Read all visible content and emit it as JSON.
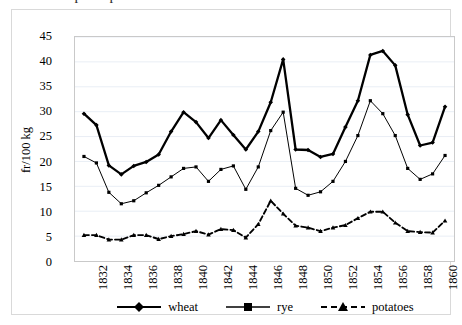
{
  "title_cropped": "Graph of prices",
  "axes": {
    "y_title": "fr/100 kg",
    "y_ticks": [
      0,
      5,
      10,
      15,
      20,
      25,
      30,
      35,
      40,
      45
    ],
    "x_ticks": [
      1832,
      1834,
      1836,
      1838,
      1840,
      1842,
      1844,
      1846,
      1848,
      1850,
      1852,
      1854,
      1856,
      1858,
      1860
    ]
  },
  "legend": {
    "position": "bottom",
    "items": [
      {
        "label": "wheat",
        "marker": "diamond-marker",
        "line": "solid",
        "color": "#000000"
      },
      {
        "label": "rye",
        "marker": "square-marker",
        "line": "solid",
        "color": "#000000"
      },
      {
        "label": "potatoes",
        "marker": "triangle-marker",
        "line": "dashed",
        "color": "#000000"
      }
    ]
  },
  "chart_data": {
    "type": "line",
    "title": "Graph of prices",
    "xlabel": "",
    "ylabel": "fr/100 kg",
    "ylim": [
      0,
      45
    ],
    "xlim": [
      1831,
      1860
    ],
    "grid": "horizontal",
    "x": [
      1831,
      1832,
      1833,
      1834,
      1835,
      1836,
      1837,
      1838,
      1839,
      1840,
      1841,
      1842,
      1843,
      1844,
      1845,
      1846,
      1847,
      1848,
      1849,
      1850,
      1851,
      1852,
      1853,
      1854,
      1855,
      1856,
      1857,
      1858,
      1859,
      1860
    ],
    "categories": [
      "1831",
      "1832",
      "1833",
      "1834",
      "1835",
      "1836",
      "1837",
      "1838",
      "1839",
      "1840",
      "1841",
      "1842",
      "1843",
      "1844",
      "1845",
      "1846",
      "1847",
      "1848",
      "1849",
      "1850",
      "1851",
      "1852",
      "1853",
      "1854",
      "1855",
      "1856",
      "1857",
      "1858",
      "1859",
      "1860"
    ],
    "series": [
      {
        "name": "wheat",
        "marker": "diamond",
        "linestyle": "solid",
        "color": "#000000",
        "values": [
          29.6,
          27.3,
          19.2,
          17.4,
          19.1,
          19.9,
          21.4,
          26.0,
          29.9,
          27.9,
          24.7,
          28.3,
          25.3,
          22.4,
          26.0,
          31.9,
          40.5,
          22.4,
          22.3,
          20.9,
          21.5,
          26.9,
          32.2,
          41.4,
          42.2,
          39.3,
          29.4,
          23.2,
          23.8,
          31.0
        ]
      },
      {
        "name": "rye",
        "marker": "square",
        "linestyle": "solid",
        "color": "#000000",
        "values": [
          21.0,
          19.7,
          13.8,
          11.5,
          12.1,
          13.7,
          15.2,
          16.9,
          18.6,
          18.9,
          16.0,
          18.4,
          19.1,
          14.4,
          18.9,
          26.2,
          29.9,
          14.6,
          13.2,
          13.9,
          16.0,
          20.0,
          25.2,
          32.2,
          29.6,
          25.2,
          18.6,
          16.4,
          17.5,
          21.2
        ]
      },
      {
        "name": "potatoes",
        "marker": "triangle",
        "linestyle": "dashed",
        "color": "#000000",
        "values": [
          5.2,
          5.2,
          4.3,
          4.3,
          5.2,
          5.2,
          4.4,
          5.0,
          5.4,
          6.0,
          5.3,
          6.4,
          6.2,
          4.7,
          7.4,
          12.1,
          9.5,
          7.1,
          6.7,
          6.0,
          6.7,
          7.2,
          8.6,
          9.9,
          9.9,
          7.7,
          6.0,
          5.8,
          5.7,
          8.1
        ]
      }
    ]
  }
}
